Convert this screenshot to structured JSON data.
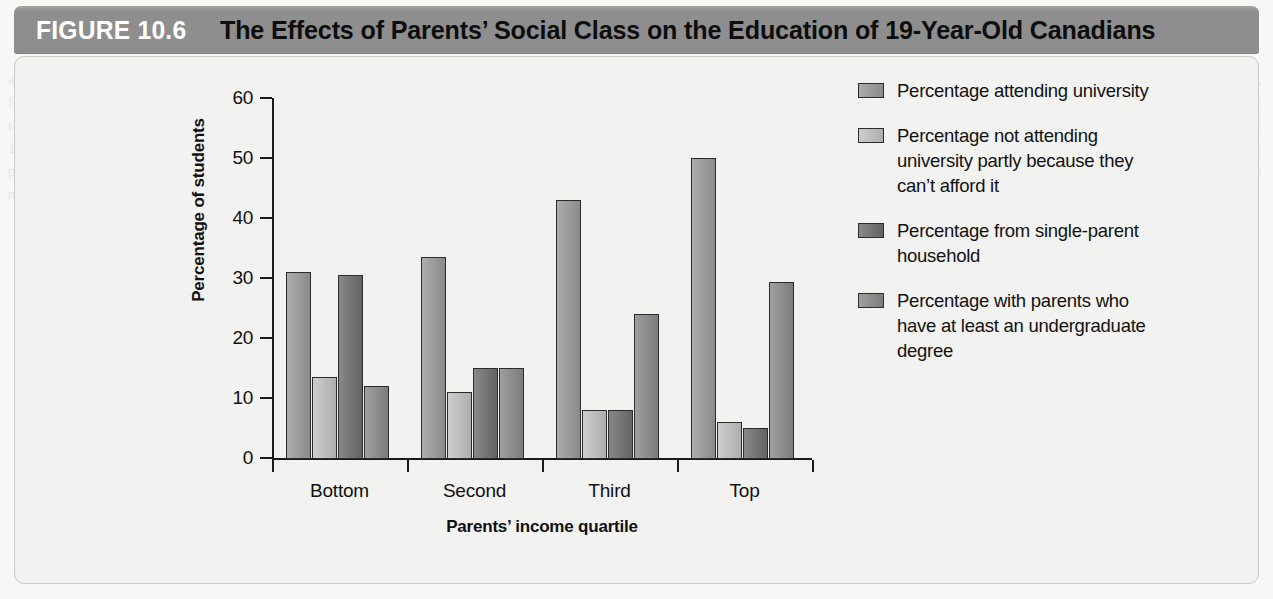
{
  "figure": {
    "number_label": "FIGURE 10.6",
    "title": "The Effects of Parents’ Social Class on the Education of 19-Year-Old Canadians",
    "header_bg": "#8e8e8e",
    "panel_bg": "#f2f2f0",
    "panel_border": "#c9c9c7"
  },
  "chart_data": {
    "type": "bar",
    "title": "The Effects of Parents’ Social Class on the Education of 19-Year-Old Canadians",
    "xlabel": "Parents’ income quartile",
    "ylabel": "Percentage of students",
    "categories": [
      "Bottom",
      "Second",
      "Third",
      "Top"
    ],
    "ylim": [
      0,
      60
    ],
    "yticks": [
      0,
      10,
      20,
      30,
      40,
      50,
      60
    ],
    "ytick_labels": [
      "0",
      "10",
      "20",
      "30",
      "40",
      "50",
      "60"
    ],
    "grid": false,
    "legend_position": "right",
    "series": [
      {
        "name": "Percentage attending university",
        "color": "#9a9a9a",
        "values": [
          31.0,
          33.5,
          43.0,
          50.0
        ]
      },
      {
        "name": "Percentage not attending university partly because they can’t afford it",
        "color": "#c2c2c2",
        "values": [
          13.5,
          11.0,
          8.0,
          6.0
        ]
      },
      {
        "name": "Percentage from single-parent household",
        "color": "#6e6e6e",
        "values": [
          30.5,
          15.0,
          8.0,
          5.0
        ]
      },
      {
        "name": "Percentage with parents who have at least an undergraduate degree",
        "color": "#8a8a8a",
        "values": [
          12.0,
          15.0,
          24.0,
          29.3
        ]
      }
    ]
  },
  "legend": {
    "items": [
      {
        "label": "Percentage attending university",
        "color": "#9a9a9a"
      },
      {
        "label": "Percentage not attending university partly because they can’t afford it",
        "color": "#c2c2c2"
      },
      {
        "label": "Percentage from single-parent household",
        "color": "#6e6e6e"
      },
      {
        "label": "Percentage with parents who have at least an undergraduate degree",
        "color": "#8a8a8a"
      }
    ]
  },
  "background_text": {
    "left_column": "and ability to attend schools and universities is typically lower than that of students in other, wealthier families. Compounding the increase in university tuition fees is the rising cost of student housing, food, and other necessities. In order to pay the costs associated with higher education, students must either take on considerable debt, work long hours while studying, or both. Students who rely on part-time employment to finance their education often find it necessary to reduce their course load and extend the number of years required to complete their degrees. Figure 10.6 presents data from a study of 19-year-olds in which the respondents were asked about their educational plans. The figure suggests that a person's likelihood of attending university is related to the socio-economic position of that person's parents. Students with parents who have at least an undergraduate degree are more likely to attend university themselves. Students from a single-parent household are less likely to attend. Perhaps most telling is that nearly one-quarter of students from the bottom income quartile reported that the reason they were not attending university was that they could not afford it."
  }
}
